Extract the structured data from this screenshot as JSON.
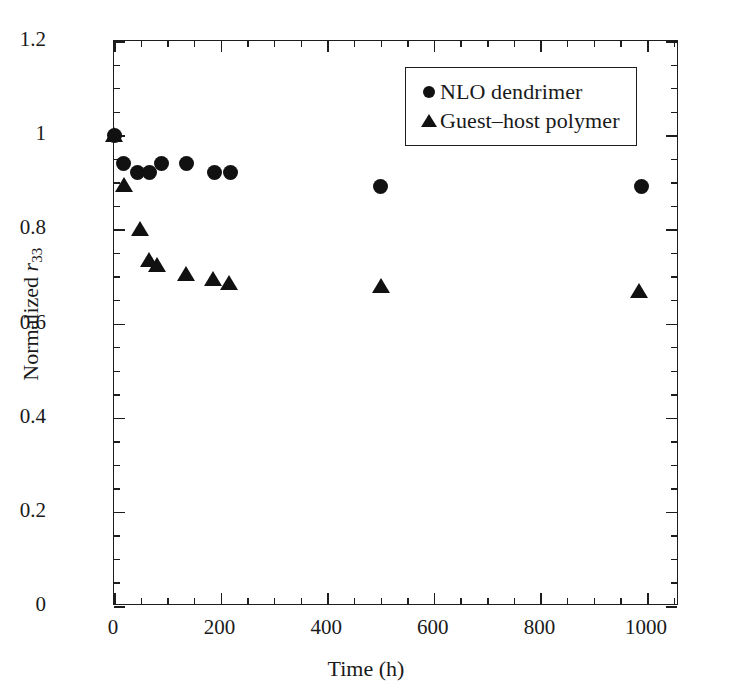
{
  "chart_data": {
    "type": "scatter",
    "title": "",
    "xlabel": "Time (h)",
    "ylabel": "Normalized r33",
    "ylabel_parts": {
      "prefix": "Normalized ",
      "italic": "r",
      "subscript": "33"
    },
    "xlim": [
      0,
      1060
    ],
    "ylim": [
      0,
      1.2
    ],
    "x_ticks": [
      0,
      200,
      400,
      600,
      800,
      1000
    ],
    "x_tick_labels": [
      "0",
      "200",
      "400",
      "600",
      "800",
      "1000"
    ],
    "x_minor_interval": 50,
    "y_ticks": [
      0,
      0.2,
      0.4,
      0.6,
      0.8,
      1.0,
      1.2
    ],
    "y_tick_labels": [
      "0",
      "0.2",
      "0.4",
      "0.6",
      "0.8",
      "1",
      "1.2"
    ],
    "y_minor_interval": 0.05,
    "grid": false,
    "legend_position": "upper right",
    "series": [
      {
        "name": "NLO dendrimer",
        "marker": "circle",
        "color": "#111111",
        "points": [
          [
            0,
            1.0
          ],
          [
            18,
            0.94
          ],
          [
            45,
            0.92
          ],
          [
            66,
            0.92
          ],
          [
            90,
            0.94
          ],
          [
            136,
            0.94
          ],
          [
            188,
            0.92
          ],
          [
            218,
            0.92
          ],
          [
            500,
            0.89
          ],
          [
            990,
            0.89
          ]
        ]
      },
      {
        "name": "Guest–host polymer",
        "marker": "triangle",
        "color": "#111111",
        "points": [
          [
            0,
            1.0
          ],
          [
            18,
            0.895
          ],
          [
            48,
            0.8
          ],
          [
            65,
            0.735
          ],
          [
            80,
            0.725
          ],
          [
            136,
            0.705
          ],
          [
            185,
            0.695
          ],
          [
            216,
            0.685
          ],
          [
            500,
            0.68
          ],
          [
            985,
            0.67
          ]
        ]
      }
    ]
  },
  "legend": {
    "entries": [
      {
        "marker": "circle",
        "label": "NLO dendrimer"
      },
      {
        "marker": "triangle",
        "label": "Guest–host polymer"
      }
    ]
  },
  "axes": {
    "x_title": "Time (h)",
    "y_title_prefix": "Normalized ",
    "y_title_symbol": "r",
    "y_title_subscript": "33"
  },
  "colors": {
    "marker": "#111111",
    "axis": "#1d1d1d",
    "background": "#ffffff",
    "text": "#1a1a1a"
  }
}
